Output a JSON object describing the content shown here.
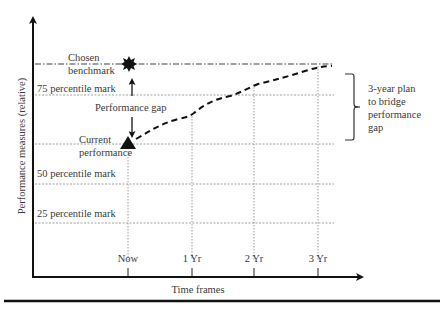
{
  "diagram": {
    "type": "performance-gap-diagram",
    "y_axis_label": "Performance measures (relative)",
    "x_axis_label": "Time frames",
    "x_ticks": [
      "Now",
      "1 Yr",
      "2 Yr",
      "3 Yr"
    ],
    "reference_lines": {
      "benchmark": {
        "label_line1": "Chosen",
        "label_line2": "benchmark"
      },
      "p75": "75 percentile mark",
      "p50": "50 percentile mark",
      "p25": "25 percentile mark"
    },
    "current": {
      "label_line1": "Current",
      "label_line2": "performance"
    },
    "gap_label": "Performance gap",
    "brace_label": [
      "3-year plan",
      "to bridge",
      "performance",
      "gap"
    ],
    "markers": {
      "benchmark_marker": "starburst",
      "current_marker": "triangle"
    },
    "plan_path": {
      "style": "dashed",
      "points": [
        [
          "Now",
          "current"
        ],
        [
          "1 Yr",
          "between current and 75th"
        ],
        [
          "2 Yr",
          "above 75th"
        ],
        [
          "3 Yr",
          "benchmark"
        ]
      ]
    },
    "colors": {
      "line": "#1a1a1a",
      "grid": "#777777",
      "text": "#3a3a3a"
    }
  }
}
